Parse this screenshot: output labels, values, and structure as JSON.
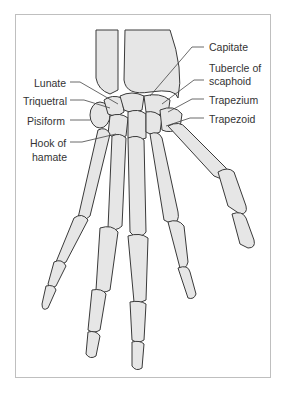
{
  "figure": {
    "colors": {
      "bone_fill": "#e6e6e6",
      "outline": "#3a3a3a",
      "frame": "#bfbfbf",
      "text": "#333333"
    },
    "labels_left": [
      {
        "id": "lunate",
        "text": "Lunate"
      },
      {
        "id": "triquetral",
        "text": "Triquetral"
      },
      {
        "id": "pisiform",
        "text": "Pisiform"
      },
      {
        "id": "hook_of_hamate_1",
        "text": "Hook of"
      },
      {
        "id": "hook_of_hamate_2",
        "text": "hamate"
      }
    ],
    "labels_right": [
      {
        "id": "capitate",
        "text": "Capitate"
      },
      {
        "id": "tubercle_1",
        "text": "Tubercle of"
      },
      {
        "id": "tubercle_2",
        "text": "scaphoid"
      },
      {
        "id": "trapezium",
        "text": "Trapezium"
      },
      {
        "id": "trapezoid",
        "text": "Trapezoid"
      }
    ]
  }
}
